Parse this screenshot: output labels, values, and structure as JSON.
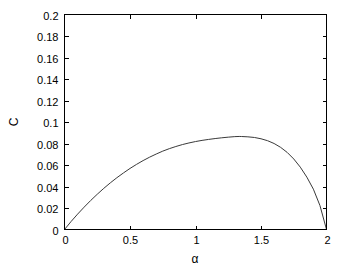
{
  "chart_data": {
    "type": "line",
    "title": "",
    "xlabel": "α",
    "ylabel": "C",
    "xlim": [
      0,
      2
    ],
    "ylim": [
      0,
      0.2
    ],
    "grid": false,
    "legend": false,
    "legend_position": "none",
    "line_color": "#3a3a3a",
    "background_color": "#ffffff",
    "axis_color": "#000000",
    "xticks": [
      0,
      0.5,
      1,
      1.5,
      2
    ],
    "xtick_labels": [
      "0",
      "0.5",
      "1",
      "1.5",
      "2"
    ],
    "yticks": [
      0,
      0.02,
      0.04,
      0.06,
      0.08,
      0.1,
      0.12,
      0.14,
      0.16,
      0.18,
      0.2
    ],
    "ytick_labels": [
      "0",
      "0.02",
      "0.04",
      "0.06",
      "0.08",
      "0.1",
      "0.12",
      "0.14",
      "0.16",
      "0.18",
      "0.2"
    ],
    "series": [
      {
        "name": "C",
        "x": [
          0,
          0.05,
          0.1,
          0.15,
          0.2,
          0.25,
          0.3,
          0.35,
          0.4,
          0.45,
          0.5,
          0.55,
          0.6,
          0.65,
          0.7,
          0.75,
          0.8,
          0.85,
          0.9,
          0.95,
          1.0,
          1.05,
          1.1,
          1.15,
          1.2,
          1.25,
          1.3,
          1.3333,
          1.35,
          1.4,
          1.45,
          1.5,
          1.55,
          1.6,
          1.65,
          1.7,
          1.75,
          1.8,
          1.85,
          1.9,
          1.95,
          2.0
        ],
        "y": [
          0,
          0.0074,
          0.0143,
          0.0208,
          0.027,
          0.0328,
          0.0383,
          0.0434,
          0.0482,
          0.0526,
          0.0568,
          0.0606,
          0.0641,
          0.0673,
          0.0702,
          0.0729,
          0.0752,
          0.0772,
          0.079,
          0.0805,
          0.0818,
          0.0829,
          0.0838,
          0.0846,
          0.0853,
          0.0859,
          0.0864,
          0.08655,
          0.0865,
          0.0862,
          0.0856,
          0.0844,
          0.0826,
          0.08,
          0.0764,
          0.0717,
          0.0656,
          0.058,
          0.0487,
          0.0375,
          0.0223,
          0
        ]
      }
    ],
    "peak": {
      "x": 1.3333,
      "y": 0.18
    }
  }
}
